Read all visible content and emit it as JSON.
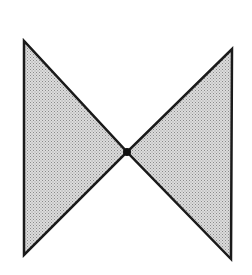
{
  "diagram": {
    "type": "bowtie",
    "colors": {
      "background": "#ffffff",
      "stroke": "#1a1a1a",
      "fill_dot": "#8a8a8a",
      "fill_base": "#dcdcdc",
      "vertex": "#111111"
    },
    "vertex": {
      "x": 127,
      "y": 152,
      "r": 4
    },
    "triangles": [
      {
        "name": "left-triangle",
        "points": [
          [
            24,
            41
          ],
          [
            24,
            255
          ],
          [
            127,
            152
          ]
        ]
      },
      {
        "name": "right-triangle",
        "points": [
          [
            232,
            49
          ],
          [
            231,
            259
          ],
          [
            127,
            152
          ]
        ]
      }
    ]
  }
}
